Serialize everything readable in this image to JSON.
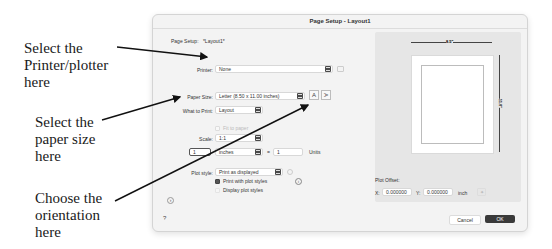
{
  "annotations": [
    {
      "lines": [
        "Select the",
        "Printer/plotter",
        "here"
      ]
    },
    {
      "lines": [
        "Select the",
        "paper size",
        "here"
      ]
    },
    {
      "lines": [
        "Choose the",
        "orientation",
        "here"
      ]
    }
  ],
  "dialog": {
    "title": "Page Setup - Layout1",
    "page_setup_label": "Page Setup:",
    "page_setup_value": "*Layout1*",
    "printer": {
      "label": "Printer:",
      "value": "None"
    },
    "paper_size": {
      "label": "Paper Size:",
      "value": "Letter (8.50 x 11.00 inches)"
    },
    "orientation": {
      "portrait": "A",
      "landscape": "A"
    },
    "what_to_print": {
      "label": "What to Print:",
      "value": "Layout"
    },
    "fit_to_paper": "Fit to paper",
    "scale": {
      "label": "Scale:",
      "value": "1:1"
    },
    "scale_ratio": {
      "left": "1",
      "units": "inches",
      "equals": "=",
      "right": "1",
      "units_label": "Units"
    },
    "plot_style": {
      "label": "Plot style:",
      "value": "Print as displayed"
    },
    "print_with_plot_styles": {
      "label": "Print with plot styles",
      "checked": true
    },
    "display_plot_styles": {
      "label": "Display plot styles",
      "checked": false
    },
    "info_icon": "i",
    "expand_icon": "›",
    "help": "?",
    "preview": {
      "width_label": "8.5\"",
      "height_label": "11.0\""
    },
    "plot_offset": {
      "label": "Plot Offset:",
      "x_label": "X:",
      "x_value": "0.000000",
      "y_label": "Y:",
      "y_value": "0.000000",
      "unit": "inch"
    },
    "cancel": "Cancel",
    "ok": "OK",
    "accent_color": "#3a3a3a"
  }
}
